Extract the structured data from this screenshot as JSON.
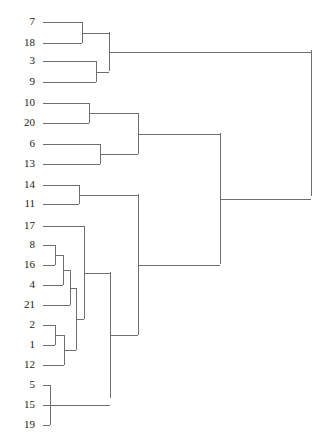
{
  "chart_data": {
    "type": "dendrogram",
    "title": "",
    "xlabel": "",
    "ylabel": "",
    "orientation": "horizontal-left-to-right",
    "grid": false,
    "legend": null,
    "leaf_count": 21,
    "leaf_order": [
      "7",
      "18",
      "3",
      "9",
      "10",
      "20",
      "6",
      "13",
      "14",
      "11",
      "17",
      "8",
      "16",
      "4",
      "21",
      "2",
      "1",
      "12",
      "5",
      "15",
      "19"
    ],
    "leaf_positions_px": [
      22,
      43,
      61,
      82,
      103,
      123,
      144,
      164,
      185,
      204,
      226,
      245,
      265,
      285,
      305,
      325,
      345,
      365,
      385,
      405,
      425
    ],
    "leaf_line_start_x": 43,
    "root_x": 311,
    "axis_range_px": [
      43,
      311
    ],
    "line_color": "#6e6e6e",
    "label_color": "#1a1a1a",
    "background_color": "#ffffff",
    "merges": [
      {
        "id": "m1",
        "label": "7 + 18",
        "x": 82,
        "y_top": 22,
        "y_bottom": 43
      },
      {
        "id": "m2",
        "label": "3 + 9",
        "x": 96,
        "y_top": 61,
        "y_bottom": 82
      },
      {
        "id": "m3",
        "label": "(7,18) + (3,9)",
        "x": 109,
        "y_top": 32,
        "y_bottom": 71
      },
      {
        "id": "m4",
        "label": "10 + 20",
        "x": 89,
        "y_top": 103,
        "y_bottom": 123
      },
      {
        "id": "m5",
        "label": "6 + 13",
        "x": 100,
        "y_top": 144,
        "y_bottom": 164
      },
      {
        "id": "m6",
        "label": "(10,20) + (6,13)",
        "x": 138,
        "y_top": 113,
        "y_bottom": 154
      },
      {
        "id": "m7",
        "label": "14 + 11",
        "x": 79,
        "y_top": 185,
        "y_bottom": 204
      },
      {
        "id": "m8",
        "label": "8 + 16",
        "x": 55,
        "y_top": 245,
        "y_bottom": 265
      },
      {
        "id": "m9",
        "label": "(8,16) + 4",
        "x": 63,
        "y_top": 255,
        "y_bottom": 285
      },
      {
        "id": "m10",
        "label": "(8,16,4) + 21",
        "x": 70,
        "y_top": 270,
        "y_bottom": 305
      },
      {
        "id": "m11",
        "label": "2 + 1",
        "x": 55,
        "y_top": 325,
        "y_bottom": 345
      },
      {
        "id": "m12",
        "label": "(2,1) + 12",
        "x": 64,
        "y_top": 335,
        "y_bottom": 365
      },
      {
        "id": "m13",
        "label": "(8,16,4,21) + (2,1,12)",
        "x": 76,
        "y_top": 288,
        "y_bottom": 350
      },
      {
        "id": "m14",
        "label": "17 + lower-group",
        "x": 84,
        "y_top": 226,
        "y_bottom": 319
      },
      {
        "id": "m15",
        "label": "5 + 15 + 19",
        "x": 50,
        "y_top": 385,
        "y_bottom": 425
      },
      {
        "id": "m16",
        "label": "(17,...) + (5,15,19)",
        "x": 110,
        "y_top": 272,
        "y_bottom": 398
      },
      {
        "id": "m17",
        "label": "(14,11) + bottom",
        "x": 138,
        "y_top": 194,
        "y_bottom": 335
      },
      {
        "id": "m18",
        "label": "middle + bottom",
        "x": 220,
        "y_top": 133,
        "y_bottom": 264
      },
      {
        "id": "m19",
        "label": "root",
        "x": 311,
        "y_top": 50,
        "y_bottom": 196
      }
    ]
  },
  "figure": {
    "width_px": 331,
    "height_px": 447
  }
}
